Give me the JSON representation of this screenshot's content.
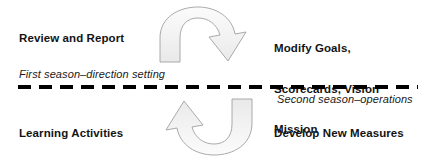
{
  "diagram": {
    "title_absent": true,
    "background_color": "#ffffff",
    "text_color": "#141414",
    "divider_color": "#000000",
    "arrow_fill": "#f7f7f7",
    "arrow_stroke": "#9a9a9a",
    "labels": {
      "review_and_report": "Review and Report",
      "modify_goals_line1": "Modify Goals,",
      "modify_goals_line2": "Scorecards, Vision",
      "modify_goals_line3": "Mission",
      "learning_activities": "Learning Activities",
      "develop_new_measures": "Develop New Measures",
      "first_season": "First season–direction setting",
      "second_season": "Second season–operations"
    },
    "icons": {
      "top_arrow": "curved-arrow-right-down-icon",
      "bottom_arrow": "curved-arrow-left-up-icon",
      "divider": "dashed-divider-icon"
    }
  }
}
